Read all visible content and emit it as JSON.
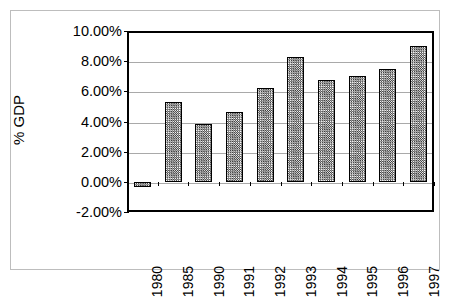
{
  "chart_data": {
    "type": "bar",
    "title": "",
    "subtitle": "",
    "xlabel": "",
    "ylabel": "% GDP",
    "categories": [
      "1980",
      "1985",
      "1990",
      "1991",
      "1992",
      "1993",
      "1994",
      "1995",
      "1996",
      "1997"
    ],
    "values": [
      -0.35,
      5.3,
      3.85,
      4.6,
      6.25,
      8.25,
      6.75,
      7.0,
      7.5,
      9.0
    ],
    "value_labels": [
      "-0.35%",
      "5.30%",
      "3.85%",
      "4.60%",
      "6.25%",
      "8.25%",
      "6.75%",
      "7.00%",
      "7.50%",
      "9.00%"
    ],
    "ylim": [
      -2,
      10
    ],
    "ytick_values": [
      10,
      8,
      6,
      4,
      2,
      0,
      -2
    ],
    "ytick_labels": [
      "10.00%",
      "8.00%",
      "6.00%",
      "4.00%",
      "2.00%",
      "0.00%",
      "-2.00%"
    ],
    "grid": true,
    "grid_axis": "y",
    "legend": false,
    "legend_position": "none",
    "series": [
      {
        "name": "% GDP",
        "values": [
          -0.35,
          5.3,
          3.85,
          4.6,
          6.25,
          8.25,
          6.75,
          7.0,
          7.5,
          9.0
        ]
      }
    ],
    "annotations": []
  },
  "style": {
    "bar_fill": "#808080",
    "bar_pattern": "checkerboard-dither",
    "bar_edge": "#000000",
    "gridline_color": "#a9a9a9",
    "axis_color": "#000000",
    "plot_background": "#ffffff",
    "figure_background": "#ffffff",
    "outer_border": "#bdbdbd",
    "text_color": "#000000"
  }
}
